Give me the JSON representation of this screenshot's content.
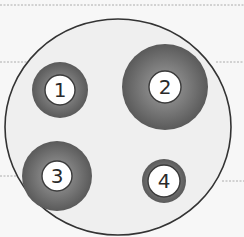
{
  "diagram": {
    "background_color": "#f7f7f7",
    "plate": {
      "label": "plate",
      "fill": "#efefef",
      "stroke": "#333333",
      "cx": 118,
      "cy": 127,
      "rx": 113,
      "ry": 108
    },
    "guide_lines": [
      {
        "x1": 0,
        "y1": 5,
        "x2": 244,
        "y2": 5
      },
      {
        "x1": 0,
        "y1": 62,
        "x2": 30,
        "y2": 62
      },
      {
        "x1": 216,
        "y1": 62,
        "x2": 244,
        "y2": 62
      },
      {
        "x1": 0,
        "y1": 176,
        "x2": 38,
        "y2": 176
      },
      {
        "x1": 222,
        "y1": 181,
        "x2": 244,
        "y2": 181
      }
    ],
    "rings": [
      {
        "id": "1",
        "label": "1",
        "cx": 60,
        "cy": 90,
        "outer_r": 28,
        "inner_r": 15
      },
      {
        "id": "2",
        "label": "2",
        "cx": 165,
        "cy": 87,
        "outer_r": 43,
        "inner_r": 16
      },
      {
        "id": "3",
        "label": "3",
        "cx": 57,
        "cy": 176,
        "outer_r": 35,
        "inner_r": 15
      },
      {
        "id": "4",
        "label": "4",
        "cx": 164,
        "cy": 181,
        "outer_r": 22,
        "inner_r": 16
      }
    ],
    "colors": {
      "ring_dark": "#5a5a5a",
      "ring_light": "#8a8a8a",
      "inner_fill": "#ffffff",
      "inner_stroke": "#3a3a3a",
      "guide_line": "#9a9a9a"
    }
  }
}
